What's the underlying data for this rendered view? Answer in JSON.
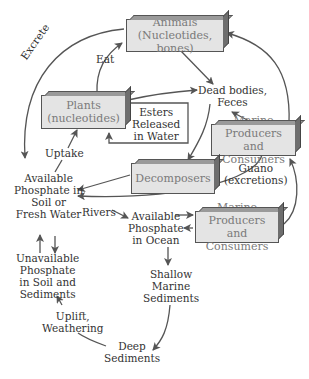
{
  "diagram": {
    "boxes": {
      "animals": [
        "Animals",
        "(Nucleotides, bones)"
      ],
      "plants": [
        "Plants",
        "(nucleotides)"
      ],
      "marine_top": [
        "Marine Producers",
        "and Consumers"
      ],
      "decomposers": [
        "Decomposers"
      ],
      "marine_bottom": [
        "Marine Producers",
        "and Consumers"
      ]
    },
    "labels": {
      "excrete": "Excrete",
      "eat": "Eat",
      "dead_bodies": [
        "Dead bodies,",
        "Feces"
      ],
      "esters": [
        "Esters",
        "Released",
        "in Water"
      ],
      "uptake": "Uptake",
      "guano": [
        "Guano",
        "(excretions)"
      ],
      "avail_soil": [
        "Available",
        "Phosphate in",
        "Soil or",
        "Fresh Water"
      ],
      "rivers": "Rivers",
      "avail_ocean": [
        "Available",
        "Phosphate",
        "in Ocean"
      ],
      "unavail": [
        "Unavailable",
        "Phosphate",
        "in Soil and",
        "Sediments"
      ],
      "shallow": [
        "Shallow",
        "Marine",
        "Sediments"
      ],
      "uplift": [
        "Uplift,",
        "Weathering"
      ],
      "deep": [
        "Deep",
        "Sediments"
      ]
    },
    "colors": {
      "box_fill": "#e4e4e4",
      "box_text": "#7a7a7a",
      "arrow": "#555555",
      "label_text": "#333333"
    }
  }
}
